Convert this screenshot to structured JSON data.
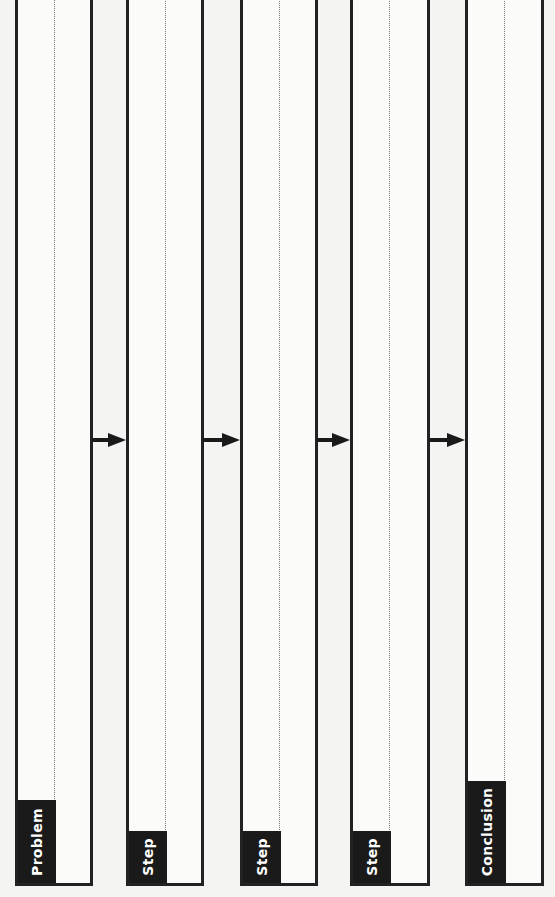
{
  "diagram": {
    "type": "flow",
    "direction": "left-to-right",
    "columns": [
      {
        "id": "problem",
        "label": "Problem"
      },
      {
        "id": "step1",
        "label": "Step"
      },
      {
        "id": "step2",
        "label": "Step"
      },
      {
        "id": "step3",
        "label": "Step"
      },
      {
        "id": "conclusion",
        "label": "Conclusion"
      }
    ],
    "arrows": [
      {
        "from": "problem",
        "to": "step1"
      },
      {
        "from": "step1",
        "to": "step2"
      },
      {
        "from": "step2",
        "to": "step3"
      },
      {
        "from": "step3",
        "to": "conclusion"
      }
    ],
    "colors": {
      "border": "#222222",
      "label_bg": "#1a1a1a",
      "label_text": "#ffffff",
      "background": "#f4f4f3"
    }
  }
}
